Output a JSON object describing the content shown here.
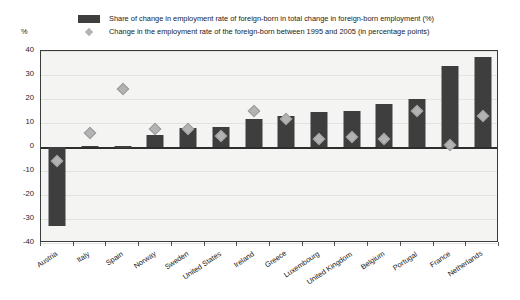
{
  "chart_data": {
    "type": "bar",
    "title": "",
    "xlabel": "",
    "ylabel": "%",
    "ylim": [
      -40,
      40
    ],
    "yticks": [
      40,
      30,
      20,
      10,
      0,
      -10,
      -20,
      -30,
      -40
    ],
    "grid": true,
    "legend_position": "top",
    "categories": [
      "Austria",
      "Italy",
      "Spain",
      "Norway",
      "Sweden",
      "United States",
      "Ireland",
      "Greece",
      "Luxembourg",
      "United Kingdom",
      "Belgium",
      "Portugal",
      "France",
      "Netherlands"
    ],
    "series": [
      {
        "name": "Share of change in employment rate of foreign-born in total change in foreign-born employment (%)",
        "type": "bar",
        "color": "#3e3e3e",
        "values": [
          -33.0,
          0.5,
          0.3,
          4.8,
          8.0,
          8.5,
          11.5,
          13.0,
          14.5,
          15.0,
          17.8,
          19.8,
          33.8,
          37.5
        ]
      },
      {
        "name": "Change in the employment rate of the foreign-born between 1995 and 2005 (in percentage points)",
        "type": "scatter",
        "marker": "diamond",
        "color": "#b3b3b3",
        "values": [
          -6.0,
          6.0,
          24.0,
          7.5,
          7.5,
          4.5,
          15.0,
          11.5,
          3.5,
          4.0,
          3.5,
          15.0,
          1.0,
          13.0
        ]
      }
    ]
  },
  "legend": {
    "items": [
      {
        "marker": "bar-swatch",
        "label": "Share of change in employment rate of foreign-born in total change in foreign-born employment (%)"
      },
      {
        "marker": "diamond-swatch",
        "label": "Change in the employment rate of the foreign-born between 1995 and 2005 (in percentage points)"
      }
    ]
  },
  "axis": {
    "y_unit_label": "%"
  }
}
